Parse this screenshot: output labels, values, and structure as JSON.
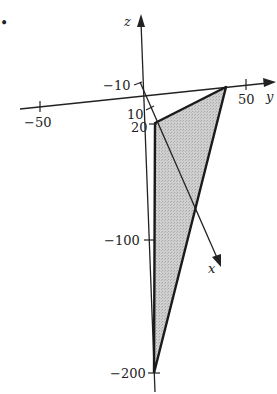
{
  "figure": {
    "bullet": "•",
    "axes": {
      "z": {
        "label": "z"
      },
      "y": {
        "label": "y"
      },
      "x": {
        "label": "x"
      }
    },
    "ticks": {
      "z_neg10": "−10",
      "x_10": "10",
      "x_20": "20",
      "y_neg50": "−50",
      "y_50": "50",
      "z_neg100": "−100",
      "z_neg200": "−200"
    },
    "region": {
      "description": "shaded triangle with vertices on the three coordinate axes",
      "fill_color": "#c8c8c8",
      "edge_color": "#1a1a1a"
    }
  }
}
